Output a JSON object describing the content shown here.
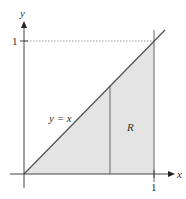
{
  "diagram": {
    "axes": {
      "x_label": "x",
      "y_label": "y"
    },
    "ticks": {
      "x_one": "1",
      "y_one": "1"
    },
    "curve_label": "y = x",
    "region_label": "R",
    "colors": {
      "shade": "#e4e4e4",
      "line": "#555555",
      "axis": "#444444",
      "dotted": "#999999"
    }
  }
}
